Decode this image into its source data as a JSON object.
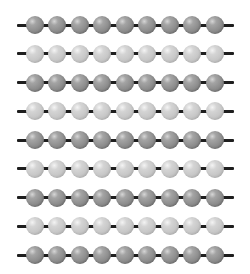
{
  "figure": {
    "rows_count": 9,
    "beads_per_row": 9,
    "row_tones": [
      "dark",
      "light",
      "dark",
      "light",
      "dark",
      "light",
      "dark",
      "light",
      "dark"
    ],
    "colors": {
      "dark_bead": "#8e8e8e",
      "light_bead": "#c6c6c6",
      "string": "#1e1e1e",
      "background": "#ffffff"
    },
    "layout": {
      "row_centers_y": [
        25,
        53.75,
        82.5,
        111.25,
        140,
        168.75,
        197.5,
        226.25,
        255
      ],
      "bead_centers_x": [
        34.5,
        57,
        79.5,
        102,
        124.5,
        147,
        169.5,
        192,
        214.5
      ],
      "bead_diameter": 18,
      "string_start_x": 17,
      "string_end_x": 234
    }
  }
}
